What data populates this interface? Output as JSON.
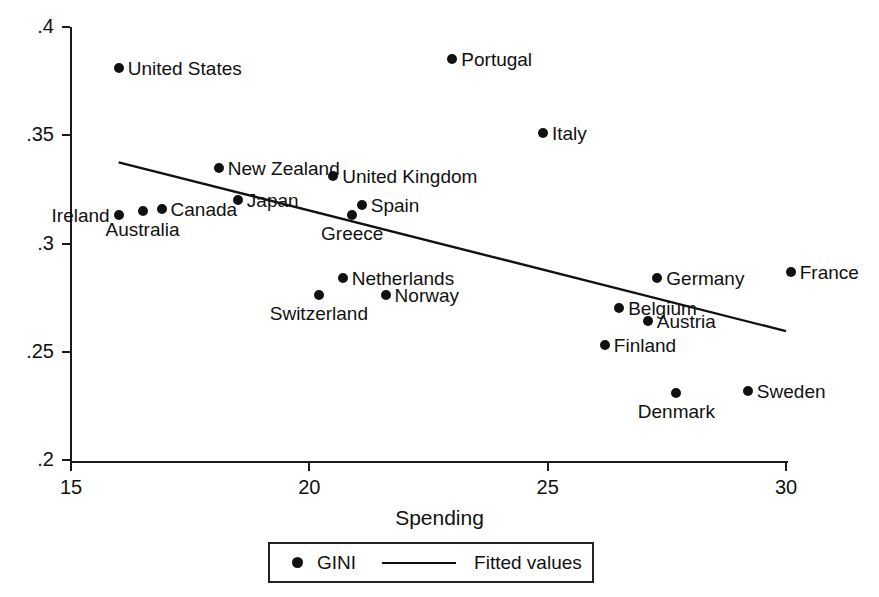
{
  "chart_data": {
    "type": "scatter",
    "title": "",
    "xlabel": "Spending",
    "ylabel": "",
    "xlim": [
      15,
      30.5
    ],
    "ylim": [
      0.2,
      0.4
    ],
    "grid": false,
    "xticks": [
      "15",
      "20",
      "25",
      "30"
    ],
    "xtick_values": [
      15,
      20,
      25,
      30
    ],
    "yticks": [
      ".4",
      ".35",
      ".3",
      ".25",
      ".2"
    ],
    "ytick_values": [
      0.4,
      0.35,
      0.3,
      0.25,
      0.2
    ],
    "legend": {
      "position": "bottom-center",
      "entries": [
        {
          "label": "GINI",
          "marker": "filled-circle"
        },
        {
          "label": "Fitted values",
          "marker": "line"
        }
      ]
    },
    "series": [
      {
        "name": "GINI",
        "points": [
          {
            "label": "United States",
            "x": 16.0,
            "y": 0.381,
            "label_pos": "right"
          },
          {
            "label": "Ireland",
            "x": 16.0,
            "y": 0.313,
            "label_pos": "left"
          },
          {
            "label": "Australia",
            "x": 16.5,
            "y": 0.315,
            "label_pos": "below"
          },
          {
            "label": "Canada",
            "x": 16.9,
            "y": 0.316,
            "label_pos": "right"
          },
          {
            "label": "New Zealand",
            "x": 18.1,
            "y": 0.335,
            "label_pos": "right"
          },
          {
            "label": "Japan",
            "x": 18.5,
            "y": 0.32,
            "label_pos": "right"
          },
          {
            "label": "Switzerland",
            "x": 20.2,
            "y": 0.276,
            "label_pos": "below"
          },
          {
            "label": "United Kingdom",
            "x": 20.5,
            "y": 0.331,
            "label_pos": "right"
          },
          {
            "label": "Netherlands",
            "x": 20.7,
            "y": 0.284,
            "label_pos": "right"
          },
          {
            "label": "Greece",
            "x": 20.9,
            "y": 0.313,
            "label_pos": "below"
          },
          {
            "label": "Spain",
            "x": 21.1,
            "y": 0.318,
            "label_pos": "right"
          },
          {
            "label": "Norway",
            "x": 21.6,
            "y": 0.276,
            "label_pos": "right"
          },
          {
            "label": "Portugal",
            "x": 23.0,
            "y": 0.385,
            "label_pos": "right"
          },
          {
            "label": "Italy",
            "x": 24.9,
            "y": 0.351,
            "label_pos": "right"
          },
          {
            "label": "Finland",
            "x": 26.2,
            "y": 0.253,
            "label_pos": "right"
          },
          {
            "label": "Belgium",
            "x": 26.5,
            "y": 0.27,
            "label_pos": "right"
          },
          {
            "label": "Austria",
            "x": 27.1,
            "y": 0.264,
            "label_pos": "right"
          },
          {
            "label": "Germany",
            "x": 27.3,
            "y": 0.284,
            "label_pos": "right"
          },
          {
            "label": "Denmark",
            "x": 27.7,
            "y": 0.231,
            "label_pos": "below"
          },
          {
            "label": "Sweden",
            "x": 29.2,
            "y": 0.232,
            "label_pos": "right"
          },
          {
            "label": "France",
            "x": 30.1,
            "y": 0.287,
            "label_pos": "right"
          }
        ]
      },
      {
        "name": "Fitted values",
        "type": "line",
        "x_start": 16.0,
        "y_start": 0.3375,
        "x_end": 30.0,
        "y_end": 0.2595
      }
    ]
  }
}
